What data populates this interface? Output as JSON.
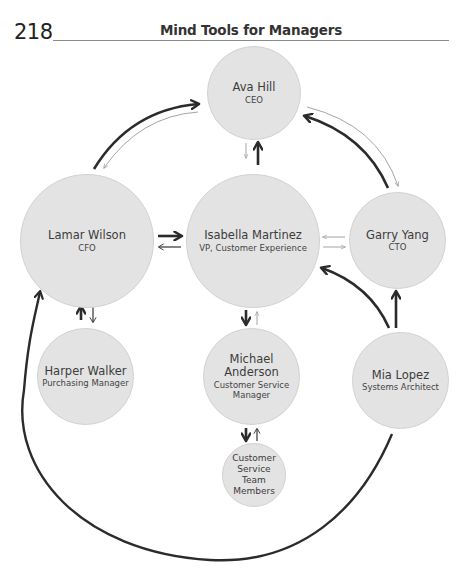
{
  "header": {
    "page_number": "218",
    "running_head": "Mind Tools for Managers"
  },
  "colors": {
    "node_fill": "#e3e3e3",
    "node_border": "#d2d2d2",
    "strong_arrow": "#2b2b2b",
    "weak_arrow": "#9a9a9a"
  },
  "nodes": {
    "ava": {
      "name": "Ava Hill",
      "role": "CEO"
    },
    "lamar": {
      "name": "Lamar Wilson",
      "role": "CFO"
    },
    "isabella": {
      "name": "Isabella Martinez",
      "role": "VP, Customer Experience"
    },
    "garry": {
      "name": "Garry Yang",
      "role": "CTO"
    },
    "harper": {
      "name": "Harper Walker",
      "role": "Purchasing Manager"
    },
    "michael": {
      "name": "Michael Anderson",
      "role_line1": "Customer Service",
      "role_line2": "Manager"
    },
    "mia": {
      "name": "Mia Lopez",
      "role": "Systems Architect"
    },
    "team": {
      "line1": "Customer",
      "line2": "Service",
      "line3": "Team",
      "line4": "Members"
    }
  },
  "edges": [
    {
      "from": "Lamar Wilson",
      "to": "Ava Hill",
      "strength": "strong"
    },
    {
      "from": "Ava Hill",
      "to": "Lamar Wilson",
      "strength": "weak"
    },
    {
      "from": "Garry Yang",
      "to": "Ava Hill",
      "strength": "strong"
    },
    {
      "from": "Ava Hill",
      "to": "Garry Yang",
      "strength": "weak"
    },
    {
      "from": "Isabella Martinez",
      "to": "Ava Hill",
      "strength": "strong"
    },
    {
      "from": "Ava Hill",
      "to": "Isabella Martinez",
      "strength": "weak"
    },
    {
      "from": "Lamar Wilson",
      "to": "Isabella Martinez",
      "strength": "strong"
    },
    {
      "from": "Isabella Martinez",
      "to": "Lamar Wilson",
      "strength": "medium"
    },
    {
      "from": "Garry Yang",
      "to": "Isabella Martinez",
      "strength": "weak"
    },
    {
      "from": "Isabella Martinez",
      "to": "Garry Yang",
      "strength": "weak"
    },
    {
      "from": "Harper Walker",
      "to": "Lamar Wilson",
      "strength": "strong"
    },
    {
      "from": "Lamar Wilson",
      "to": "Harper Walker",
      "strength": "medium"
    },
    {
      "from": "Isabella Martinez",
      "to": "Michael Anderson",
      "strength": "strong"
    },
    {
      "from": "Michael Anderson",
      "to": "Isabella Martinez",
      "strength": "weak"
    },
    {
      "from": "Michael Anderson",
      "to": "Customer Service Team Members",
      "strength": "strong"
    },
    {
      "from": "Customer Service Team Members",
      "to": "Michael Anderson",
      "strength": "medium"
    },
    {
      "from": "Mia Lopez",
      "to": "Garry Yang",
      "strength": "strong"
    },
    {
      "from": "Mia Lopez",
      "to": "Isabella Martinez",
      "strength": "strong"
    },
    {
      "from": "Mia Lopez",
      "to": "Lamar Wilson",
      "strength": "strong"
    }
  ]
}
